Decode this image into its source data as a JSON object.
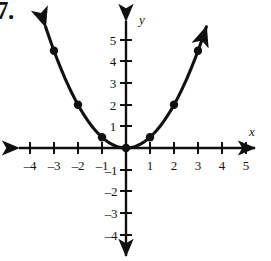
{
  "exercise": {
    "number_label": "7."
  },
  "graph": {
    "x_axis_label": "x",
    "y_axis_label": "y",
    "axis_color": "#101010",
    "curve_color": "#101010",
    "point_color": "#101010",
    "background": "#ffffff"
  },
  "chart_data": {
    "type": "line",
    "title": "",
    "subtitle": "",
    "xlabel": "x",
    "ylabel": "y",
    "grid": false,
    "legend": null,
    "axis_arrows": [
      "left",
      "right",
      "up",
      "down"
    ],
    "xlim": [
      -4.8,
      5.8
    ],
    "ylim": [
      -4.8,
      5.8
    ],
    "xticks": [
      -4,
      -3,
      -2,
      -1,
      1,
      2,
      3,
      4,
      5
    ],
    "yticks": [
      -4,
      -3,
      -2,
      -1,
      1,
      2,
      3,
      4,
      5
    ],
    "xtick_labels": [
      "–4",
      "–3",
      "–2",
      "–1",
      "1",
      "2",
      "3",
      "4",
      "5"
    ],
    "ytick_labels": [
      "–4",
      "–3",
      "–2",
      "–1",
      "1",
      "2",
      "3",
      "4",
      "5"
    ],
    "equation": "y = x²/2",
    "series": [
      {
        "name": "y = x²/2",
        "marker": "filled-circle",
        "arrow_start": true,
        "arrow_end": true,
        "x": [
          -3,
          -2,
          -1,
          0,
          1,
          2,
          3
        ],
        "values": [
          4.5,
          2,
          0.5,
          0,
          0.5,
          2,
          4.5
        ]
      }
    ],
    "marked_points": [
      {
        "x": -3,
        "y": 4.5
      },
      {
        "x": -2,
        "y": 2
      },
      {
        "x": -1,
        "y": 0.5
      },
      {
        "x": 0,
        "y": 0
      },
      {
        "x": 1,
        "y": 0.5
      },
      {
        "x": 2,
        "y": 2
      },
      {
        "x": 3,
        "y": 4.5
      }
    ]
  }
}
